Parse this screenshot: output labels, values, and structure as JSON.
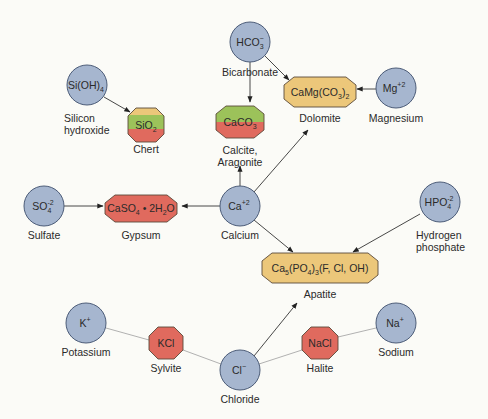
{
  "colors": {
    "ion_fill": "#a6b6cf",
    "ion_stroke": "#4c5c78",
    "carbonate_phosphate_fill": "#ecc77a",
    "evaporite_fill": "#e06a5e",
    "silica_green": "#9cc25a",
    "silica_yellow": "#ecc77a",
    "background": "#fbfbf7"
  },
  "ions": [
    {
      "id": "bicarbonate",
      "formula": "HCO",
      "sub": "3",
      "sup": "−",
      "name": "Bicarbonate"
    },
    {
      "id": "silicon-hydroxide",
      "formula": "Si(OH)",
      "sub": "4",
      "sup": "",
      "name_line1": "Silicon",
      "name_line2": "hydroxide"
    },
    {
      "id": "magnesium",
      "formula": "Mg",
      "sub": "",
      "sup": "+2",
      "name": "Magnesium"
    },
    {
      "id": "sulfate",
      "formula": "SO",
      "sub": "4",
      "sup": "-2",
      "name": "Sulfate"
    },
    {
      "id": "calcium",
      "formula": "Ca",
      "sub": "",
      "sup": "+2",
      "name": "Calcium"
    },
    {
      "id": "hydrogen-phosphate",
      "formula": "HPO",
      "sub": "4",
      "sup": "-2",
      "name_line1": "Hydrogen",
      "name_line2": "phosphate"
    },
    {
      "id": "potassium",
      "formula": "K",
      "sub": "",
      "sup": "+",
      "name": "Potassium"
    },
    {
      "id": "chloride",
      "formula": "Cl",
      "sub": "",
      "sup": "−",
      "name": "Chloride"
    },
    {
      "id": "sodium",
      "formula": "Na",
      "sub": "",
      "sup": "+",
      "name": "Sodium"
    }
  ],
  "minerals": [
    {
      "id": "chert",
      "formula_a": "SiO",
      "formula_sub": "2",
      "name": "Chert"
    },
    {
      "id": "calcite",
      "formula_a": "CaCO",
      "formula_sub": "3",
      "name_line1": "Calcite,",
      "name_line2": "Aragonite"
    },
    {
      "id": "dolomite",
      "formula_a": "CaMg(CO",
      "formula_sub": "3",
      "formula_b": ")",
      "formula_sub2": "2",
      "name": "Dolomite"
    },
    {
      "id": "gypsum",
      "formula_a": "CaSO",
      "formula_sub": "4",
      "formula_b": " • 2H",
      "formula_sub2": "2",
      "formula_c": "O",
      "name": "Gypsum"
    },
    {
      "id": "apatite",
      "formula_a": "Ca",
      "formula_sub": "5",
      "formula_b": "(PO",
      "formula_sub2": "4",
      "formula_c": ")",
      "formula_sub3": "3",
      "formula_d": "(F, Cl, OH)",
      "name": "Apatite"
    },
    {
      "id": "sylvite",
      "formula_a": "KCl",
      "name": "Sylvite"
    },
    {
      "id": "halite",
      "formula_a": "NaCl",
      "name": "Halite"
    }
  ],
  "connections": [
    {
      "from": "Bicarbonate",
      "to": "Calcite",
      "type": "arrow"
    },
    {
      "from": "Bicarbonate",
      "to": "Dolomite",
      "type": "arrow"
    },
    {
      "from": "Silicon hydroxide",
      "to": "Chert",
      "type": "arrow"
    },
    {
      "from": "Magnesium",
      "to": "Dolomite",
      "type": "arrow"
    },
    {
      "from": "Calcium",
      "to": "Calcite",
      "type": "arrow"
    },
    {
      "from": "Calcium",
      "to": "Dolomite",
      "type": "arrow"
    },
    {
      "from": "Calcium",
      "to": "Gypsum",
      "type": "arrow"
    },
    {
      "from": "Sulfate",
      "to": "Gypsum",
      "type": "arrow"
    },
    {
      "from": "Calcium",
      "to": "Apatite",
      "type": "arrow"
    },
    {
      "from": "Hydrogen phosphate",
      "to": "Apatite",
      "type": "arrow"
    },
    {
      "from": "Chloride",
      "to": "Apatite",
      "type": "arrow"
    },
    {
      "from": "Potassium",
      "to": "Chloride",
      "type": "line",
      "via": "Sylvite"
    },
    {
      "from": "Sodium",
      "to": "Chloride",
      "type": "line",
      "via": "Halite"
    }
  ]
}
